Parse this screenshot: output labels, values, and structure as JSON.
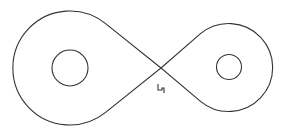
{
  "diagram": {
    "type": "figure-eight curve with two inner circles",
    "stroke_color": "#333333",
    "background_color": "#ffffff",
    "label": "4",
    "parts": [
      {
        "name": "left-lobe",
        "description": "larger outer loop"
      },
      {
        "name": "right-lobe",
        "description": "smaller outer loop"
      },
      {
        "name": "left-inner-circle",
        "description": "circle inside left lobe"
      },
      {
        "name": "right-inner-circle",
        "description": "circle inside right lobe"
      }
    ]
  }
}
